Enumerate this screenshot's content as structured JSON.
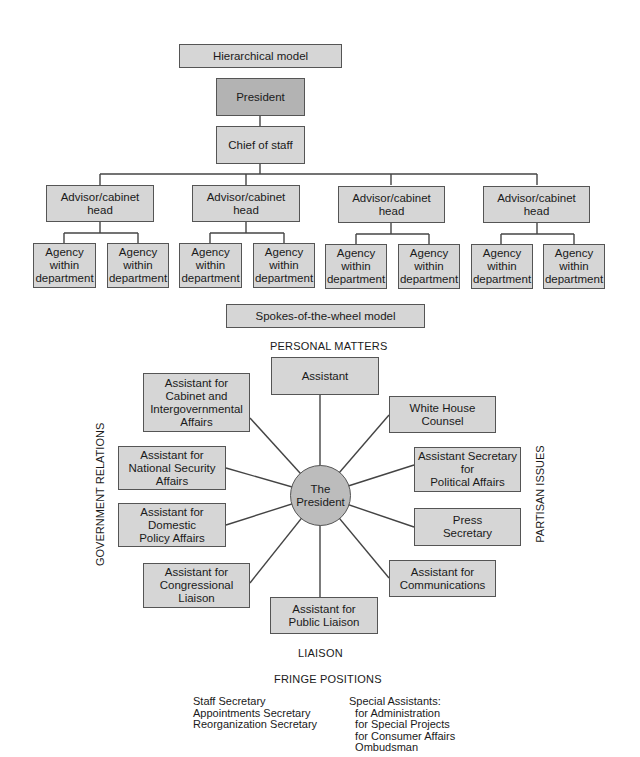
{
  "hierarchical": {
    "title": "Hierarchical model",
    "president": "President",
    "chief": "Chief of staff",
    "advisors": [
      {
        "label": "Advisor/cabinet head",
        "agencies": [
          "Agency\nwithin\ndepartment",
          "Agency\nwithin\ndepartment"
        ]
      },
      {
        "label": "Advisor/cabinet head",
        "agencies": [
          "Agency\nwithin\ndepartment",
          "Agency\nwithin\ndepartment"
        ]
      },
      {
        "label": "Advisor/cabinet head",
        "agencies": [
          "Agency\nwithin\ndepartment",
          "Agency\nwithin\ndepartment"
        ]
      },
      {
        "label": "Advisor/cabinet head",
        "agencies": [
          "Agency\nwithin\ndepartment",
          "Agency\nwithin\ndepartment"
        ]
      }
    ]
  },
  "spokes": {
    "title": "Spokes-of-the-wheel model",
    "center": "The\nPresident",
    "labels": {
      "top": "PERSONAL MATTERS",
      "left": "GOVERNMENT RELATIONS",
      "right": "PARTISAN ISSUES",
      "bottom": "LIAISON"
    },
    "nodes": {
      "assistant": "Assistant",
      "cabinet": "Assistant for\nCabinet and\nIntergovernmental\nAffairs",
      "national_security": "Assistant for\nNational Security\nAffairs",
      "domestic": "Assistant for\nDomestic\nPolicy Affairs",
      "congressional": "Assistant for\nCongressional\nLiaison",
      "public_liaison": "Assistant for\nPublic Liaison",
      "white_house_counsel": "White House\nCounsel",
      "political_affairs": "Assistant Secretary\nfor\nPolitical Affairs",
      "press": "Press\nSecretary",
      "communications": "Assistant for\nCommunications"
    }
  },
  "fringe": {
    "title": "FRINGE POSITIONS",
    "left": "Staff Secretary\nAppointments Secretary\nReorganization Secretary",
    "right": "Special Assistants:\n  for Administration\n  for Special Projects\n  for Consumer Affairs\n  Ombudsman"
  }
}
